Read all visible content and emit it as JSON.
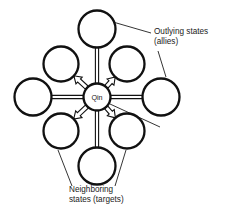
{
  "figure": {
    "background_color": "#ffffff",
    "stroke_color": "#111111",
    "text_color": "#1a1a1a"
  },
  "center_node": {
    "label": "Qin",
    "cx": 97,
    "cy": 97,
    "r": 13.5
  },
  "ring_nodes": [
    {
      "id": "north",
      "kind": "outlying",
      "cx": 97,
      "cy": 29,
      "r": 18.5,
      "connector": "double-line"
    },
    {
      "id": "south",
      "kind": "outlying",
      "cx": 97,
      "cy": 166,
      "r": 18.5,
      "connector": "double-line"
    },
    {
      "id": "east",
      "kind": "outlying",
      "cx": 161,
      "cy": 97,
      "r": 18.5,
      "connector": "double-line"
    },
    {
      "id": "west",
      "kind": "outlying",
      "cx": 33,
      "cy": 97,
      "r": 18.5,
      "connector": "double-line"
    },
    {
      "id": "northeast",
      "kind": "neighboring",
      "cx": 127,
      "cy": 64,
      "r": 17.5,
      "connector": "block-arrow"
    },
    {
      "id": "northwest",
      "kind": "neighboring",
      "cx": 61,
      "cy": 64,
      "r": 17.5,
      "connector": "block-arrow"
    },
    {
      "id": "southeast",
      "kind": "neighboring",
      "cx": 127,
      "cy": 131,
      "r": 17.5,
      "connector": "block-arrow"
    },
    {
      "id": "southwest",
      "kind": "neighboring",
      "cx": 61,
      "cy": 131,
      "r": 17.5,
      "connector": "block-arrow"
    }
  ],
  "annotations": {
    "outlying": {
      "line1": "Outlying states",
      "line2": "(allies)",
      "x": 154,
      "y": 34
    },
    "neighboring": {
      "line1": "Neighboring",
      "line2": "states (targets)",
      "x": 69,
      "y": 192
    }
  },
  "leader_lines": [
    {
      "id": "outlying-to-north",
      "x1": 151,
      "y1": 33,
      "x2": 113,
      "y2": 22
    },
    {
      "id": "outlying-to-east",
      "x1": 158,
      "y1": 51,
      "x2": 166,
      "y2": 77
    },
    {
      "id": "neighboring-to-center",
      "x1": 160,
      "y1": 127,
      "x2": 110,
      "y2": 104
    },
    {
      "id": "neighboring-to-sw",
      "x1": 72,
      "y1": 186,
      "x2": 58,
      "y2": 150
    },
    {
      "id": "neighboring-to-se",
      "x1": 115,
      "y1": 186,
      "x2": 126,
      "y2": 150
    }
  ]
}
